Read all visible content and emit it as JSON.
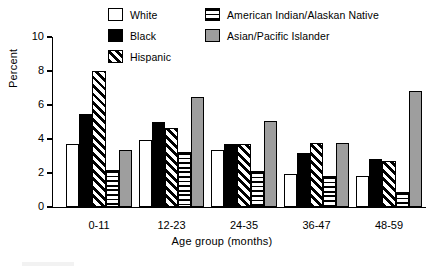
{
  "chart_data": {
    "type": "bar",
    "title": "",
    "subtitle": "",
    "xlabel": "Age group (months)",
    "ylabel": "Percent",
    "categories": [
      "0-11",
      "12-23",
      "24-35",
      "36-47",
      "48-59"
    ],
    "series": [
      {
        "name": "White",
        "fill": "solid-white",
        "values": [
          3.7,
          3.95,
          3.35,
          1.95,
          1.8
        ]
      },
      {
        "name": "Black",
        "fill": "solid-black",
        "values": [
          5.5,
          5.0,
          3.7,
          3.15,
          2.8
        ]
      },
      {
        "name": "Hispanic",
        "fill": "diagonal-hatch",
        "values": [
          8.0,
          4.65,
          3.7,
          3.75,
          2.7
        ]
      },
      {
        "name": "American Indian/Alaskan Native",
        "fill": "horizontal-hatch",
        "values": [
          2.15,
          3.25,
          2.1,
          1.8,
          0.9
        ]
      },
      {
        "name": "Asian/Pacific Islander",
        "fill": "solid-gray",
        "values": [
          3.35,
          6.5,
          5.05,
          3.75,
          6.85
        ]
      }
    ],
    "ylim": [
      0,
      10
    ],
    "yticks": [
      0,
      2,
      4,
      6,
      8,
      10
    ],
    "ytick_labels": [
      "0",
      "2",
      "4",
      "6",
      "8",
      "10"
    ],
    "grid": false,
    "legend_position": "top-center",
    "colors": {
      "white_series": "#ffffff",
      "black_series": "#000000",
      "hispanic_series": "#000000",
      "american_indian_series": "#000000",
      "asian_pacific_series": "#9e9e9e",
      "axis": "#000000",
      "background": "#ffffff"
    }
  },
  "legend": {
    "entries": [
      {
        "label": "White"
      },
      {
        "label": "Black"
      },
      {
        "label": "Hispanic"
      },
      {
        "label": "American Indian/Alaskan Native"
      },
      {
        "label": "Asian/Pacific Islander"
      }
    ]
  },
  "axes": {
    "y_title": "Percent",
    "x_title": "Age group (months)",
    "y_ticks": [
      "0",
      "2",
      "4",
      "6",
      "8",
      "10"
    ],
    "x_ticks": [
      "0-11",
      "12-23",
      "24-35",
      "36-47",
      "48-59"
    ]
  }
}
